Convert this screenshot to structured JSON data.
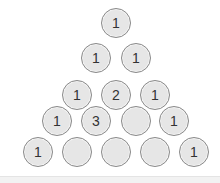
{
  "puzzle": {
    "type": "pascal-triangle",
    "rows": [
      [
        "1"
      ],
      [
        "1",
        "1"
      ],
      [
        "1",
        "2",
        "1"
      ],
      [
        "1",
        "3",
        "",
        "1"
      ],
      [
        "1",
        "",
        "",
        "",
        "1"
      ]
    ],
    "display_glyph_for_one": "I"
  },
  "colors": {
    "cell_fill": "#e6e6e6",
    "cell_border": "#8a8a8a",
    "text": "#333333",
    "footer": "#f2f2f2"
  }
}
